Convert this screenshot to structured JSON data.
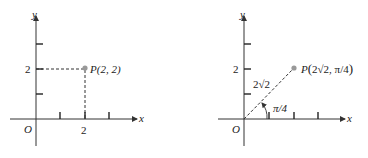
{
  "left_panel": {
    "axis_x_label": "x",
    "axis_y_label": "y",
    "origin_label": "O",
    "x_tick_label": "2",
    "y_tick_label": "2",
    "point_label": "P(2, 2)"
  },
  "right_panel": {
    "axis_x_label": "x",
    "axis_y_label": "y",
    "origin_label": "O",
    "y_tick_label": "2",
    "radius_label": "2√2",
    "angle_label": "π/4",
    "point_label_prefix": "P",
    "point_label_coords": "2√2, π/4"
  },
  "colors": {
    "point": "#999999",
    "axis": "#333333"
  }
}
